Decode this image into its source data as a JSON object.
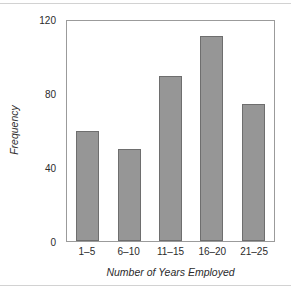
{
  "chart_data": {
    "type": "bar",
    "title": "",
    "categories": [
      "1–5",
      "6–10",
      "11–15",
      "16–20",
      "21–25"
    ],
    "values": [
      60,
      50,
      90,
      112,
      75
    ],
    "xlabel": "Number of Years Employed",
    "ylabel": "Frequency",
    "ylim": [
      0,
      120
    ],
    "yticks": [
      "0",
      "40",
      "80",
      "120"
    ],
    "ytick_values": [
      0,
      40,
      80,
      120
    ],
    "grid": false,
    "legend": null,
    "bar_color": "#969696",
    "bar_edge_color": "#6e6e6e",
    "frame_color": "#9b9b9b",
    "text_color": "#2b2b2b",
    "background": "#ffffff"
  }
}
